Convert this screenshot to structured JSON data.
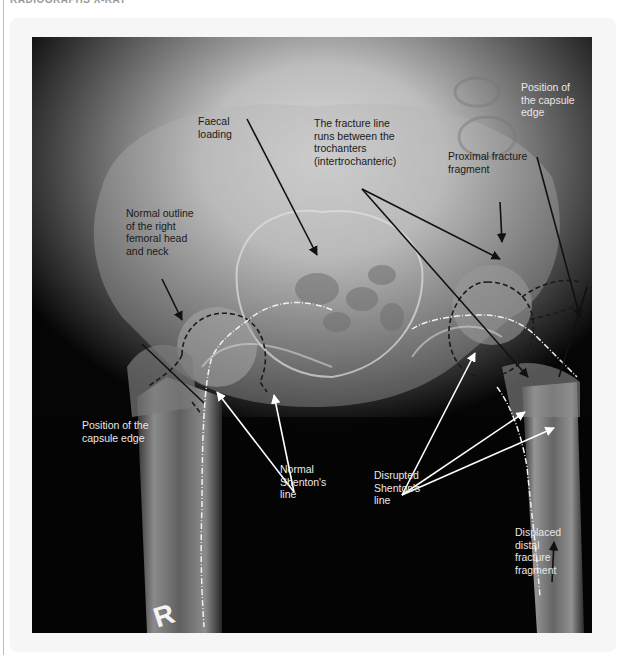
{
  "page": {
    "header_text": "RADIOGRAPHS X-RAY"
  },
  "figure": {
    "side_marker": "R",
    "labels": {
      "faecal_loading": "Faecal\nloading",
      "fracture_line": "The fracture line\nruns between the\ntrochanters\n(intertrochanteric)",
      "capsule_edge_left": "Position of the\ncapsule edge",
      "capsule_edge_right": "Position of\nthe capsule\nedge",
      "proximal_fragment": "Proximal fracture\nfragment",
      "normal_outline": "Normal outline\nof the right\nfemoral head\nand neck",
      "normal_shenton": "Normal\nShenton's\nline",
      "disrupted_shenton": "Disrupted\nShenton's\nline",
      "displaced_distal": "Displaced\ndistal\nfracture\nfragment"
    },
    "colors": {
      "dark_arrow": "#111111",
      "light_arrow": "#ffffff",
      "outline_dashed": "#1a1a1a",
      "shenton_line": "#f0f0f0"
    }
  }
}
